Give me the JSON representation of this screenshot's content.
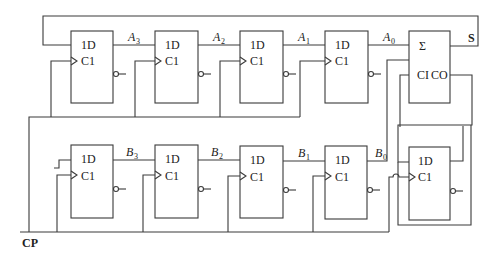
{
  "diagram": {
    "type": "serial-adder-shift-registers",
    "register_a": {
      "cells": [
        {
          "d_label": "1D",
          "clk_label": "C1",
          "output_signal": "A",
          "output_sub": "3"
        },
        {
          "d_label": "1D",
          "clk_label": "C1",
          "output_signal": "A",
          "output_sub": "2"
        },
        {
          "d_label": "1D",
          "clk_label": "C1",
          "output_signal": "A",
          "output_sub": "1"
        },
        {
          "d_label": "1D",
          "clk_label": "C1",
          "output_signal": "A",
          "output_sub": "0"
        }
      ]
    },
    "register_b": {
      "cells": [
        {
          "d_label": "1D",
          "clk_label": "C1",
          "output_signal": "B",
          "output_sub": "3"
        },
        {
          "d_label": "1D",
          "clk_label": "C1",
          "output_signal": "B",
          "output_sub": "2"
        },
        {
          "d_label": "1D",
          "clk_label": "C1",
          "output_signal": "B",
          "output_sub": "1"
        },
        {
          "d_label": "1D",
          "clk_label": "C1",
          "output_signal": "B",
          "output_sub": "0"
        }
      ]
    },
    "adder": {
      "symbol": "Σ",
      "carry_in_label": "CI",
      "carry_out_label": "CO",
      "sum_output_label": "S"
    },
    "carry_ff": {
      "d_label": "1D",
      "clk_label": "C1"
    },
    "clock_label": "CP"
  }
}
